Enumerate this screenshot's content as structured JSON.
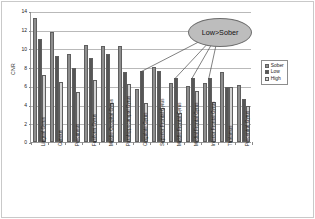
{
  "chart_data": {
    "type": "bar",
    "title": "",
    "xlabel": "",
    "ylabel": "CNR",
    "ylim": [
      0,
      14
    ],
    "ytick_step": 2,
    "yticks": [
      "14",
      "12",
      "10",
      "8",
      "6",
      "4",
      "2",
      "0"
    ],
    "grid": true,
    "legend_position": "right",
    "categories": [
      "Lingual Gyrus",
      "Cuneus",
      "Precuneus",
      "Fusiform Gyrus",
      "Middle Occipital Gyrus",
      "Parahippocampal Gyrus",
      "Cingulate Gyrus",
      "Superior Frontal Gyrus",
      "Middle Frontal Gyrus",
      "Medial Frontal Gyrus",
      "Inferior Frontal Gyrus",
      "Thalamus",
      "Precentral Gyrus"
    ],
    "series": [
      {
        "name": "Sober",
        "color": "#8e8e8e",
        "values": [
          13.3,
          11.8,
          9.4,
          10.4,
          10.3,
          10.25,
          5.65,
          8.0,
          6.35,
          6.0,
          6.35,
          7.45,
          6.1
        ]
      },
      {
        "name": "Low",
        "color": "#565656",
        "values": [
          11.0,
          9.2,
          7.95,
          9.0,
          9.45,
          7.5,
          7.55,
          7.6,
          6.8,
          6.8,
          6.8,
          5.85,
          4.6
        ]
      },
      {
        "name": "High",
        "color": "#d2d2d2",
        "values": [
          7.2,
          6.4,
          5.3,
          6.65,
          4.15,
          6.2,
          4.15,
          3.6,
          3.15,
          5.45,
          4.25,
          5.85,
          3.9
        ]
      }
    ],
    "annotations": [
      {
        "text": "Low>Sober",
        "points_to": [
          "Cingulate Gyrus",
          "Middle Frontal Gyrus",
          "Medial Frontal Gyrus",
          "Inferior Frontal Gyrus"
        ]
      }
    ]
  },
  "legend": {
    "items": [
      {
        "label": "Sober"
      },
      {
        "label": "Low"
      },
      {
        "label": "High"
      }
    ]
  },
  "axis": {
    "y_title": "CNR"
  },
  "callout": {
    "text": "Low>Sober"
  }
}
